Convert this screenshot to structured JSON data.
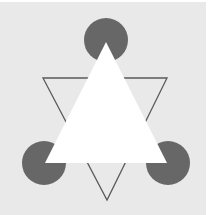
{
  "figure": {
    "colors": {
      "page": "#ffffff",
      "background": "#e9e9e9",
      "pacman": "#676767",
      "outline": "#5a5a5a",
      "illusory_triangle": "#ffffff"
    },
    "pacmen": [
      {
        "name": "top",
        "cx": 106,
        "cy": 40,
        "r": 22
      },
      {
        "name": "bottom-left",
        "cx": 44,
        "cy": 163,
        "r": 22
      },
      {
        "name": "bottom-right",
        "cx": 168,
        "cy": 163,
        "r": 22
      }
    ],
    "illusory_triangle": {
      "points": [
        [
          106,
          42
        ],
        [
          45,
          163
        ],
        [
          167,
          163
        ]
      ]
    },
    "outline_triangle": {
      "points": [
        [
          43,
          78
        ],
        [
          167,
          78
        ],
        [
          107,
          200
        ]
      ],
      "stroke_width": 1.3
    }
  }
}
